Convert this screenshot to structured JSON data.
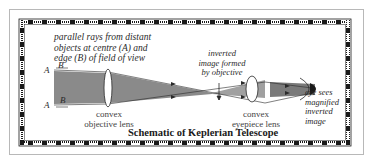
{
  "diagram": {
    "title": "Schematic of Keplerian Telescope",
    "labels": {
      "parallel_rays": [
        "parallel rays from distant",
        "objects at centre (A) and",
        "edge (B) of field of view"
      ],
      "inverted_image": [
        "inverted",
        "image formed",
        "by objective"
      ],
      "eye_sees": [
        "eye sees",
        "magnified",
        "inverted",
        "image"
      ],
      "objective_lens": [
        "convex",
        "objective lens"
      ],
      "eyepiece_lens": [
        "convex",
        "eyepiece lens"
      ],
      "point_a_top": "A",
      "point_b_top": "B",
      "point_a_bottom": "A",
      "point_b_bottom": "B"
    },
    "colors": {
      "beam_fill": "#8a8a8a",
      "line": "#2a2a2a",
      "border": "#1a1a1a",
      "background": "#ffffff"
    }
  }
}
